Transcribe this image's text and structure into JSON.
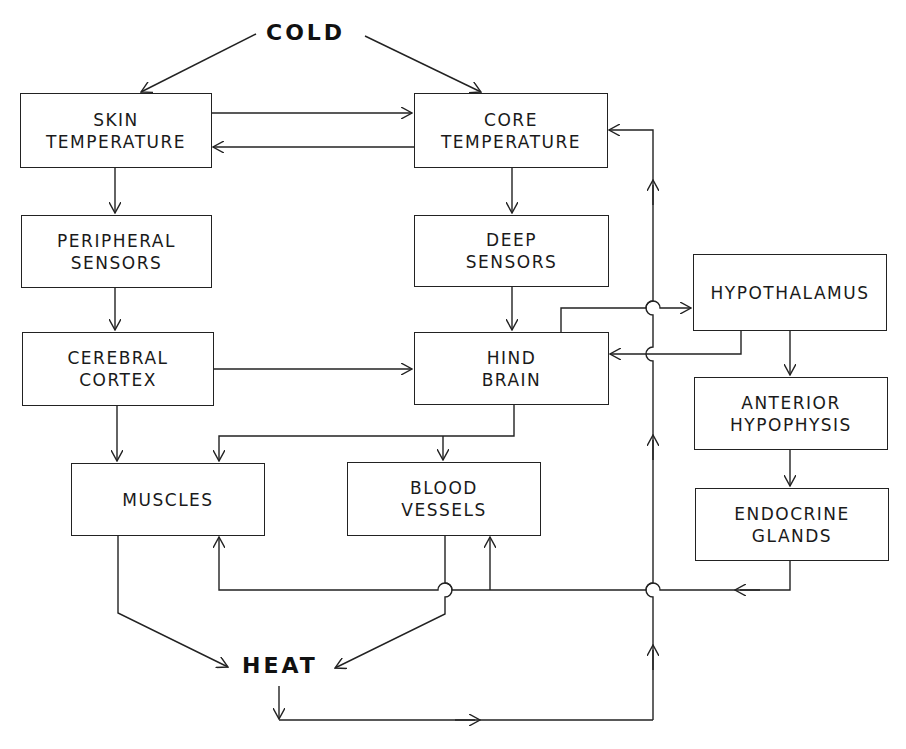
{
  "diagram": {
    "input_label": "COLD",
    "output_label": "HEAT",
    "nodes": {
      "skin_temperature": {
        "line1": "SKIN",
        "line2": "TEMPERATURE"
      },
      "core_temperature": {
        "line1": "CORE",
        "line2": "TEMPERATURE"
      },
      "peripheral_sensors": {
        "line1": "PERIPHERAL",
        "line2": "SENSORS"
      },
      "deep_sensors": {
        "line1": "DEEP",
        "line2": "SENSORS"
      },
      "cerebral_cortex": {
        "line1": "CEREBRAL",
        "line2": "CORTEX"
      },
      "hind_brain": {
        "line1": "HIND",
        "line2": "BRAIN"
      },
      "hypothalamus": {
        "line1": "HYPOTHALAMUS"
      },
      "anterior_hypophysis": {
        "line1": "ANTERIOR",
        "line2": "HYPOPHYSIS"
      },
      "endocrine_glands": {
        "line1": "ENDOCRINE",
        "line2": "GLANDS"
      },
      "muscles": {
        "line1": "MUSCLES"
      },
      "blood_vessels": {
        "line1": "BLOOD",
        "line2": "VESSELS"
      }
    },
    "edges": [
      {
        "from": "COLD",
        "to": "SKIN TEMPERATURE"
      },
      {
        "from": "COLD",
        "to": "CORE TEMPERATURE"
      },
      {
        "from": "SKIN TEMPERATURE",
        "to": "CORE TEMPERATURE"
      },
      {
        "from": "CORE TEMPERATURE",
        "to": "SKIN TEMPERATURE"
      },
      {
        "from": "SKIN TEMPERATURE",
        "to": "PERIPHERAL SENSORS"
      },
      {
        "from": "CORE TEMPERATURE",
        "to": "DEEP SENSORS"
      },
      {
        "from": "PERIPHERAL SENSORS",
        "to": "CEREBRAL CORTEX"
      },
      {
        "from": "DEEP SENSORS",
        "to": "HIND BRAIN"
      },
      {
        "from": "CEREBRAL CORTEX",
        "to": "HIND BRAIN"
      },
      {
        "from": "HIND BRAIN",
        "to": "HYPOTHALAMUS"
      },
      {
        "from": "HYPOTHALAMUS",
        "to": "HIND BRAIN"
      },
      {
        "from": "HYPOTHALAMUS",
        "to": "ANTERIOR HYPOPHYSIS"
      },
      {
        "from": "ANTERIOR HYPOPHYSIS",
        "to": "ENDOCRINE GLANDS"
      },
      {
        "from": "CEREBRAL CORTEX",
        "to": "MUSCLES"
      },
      {
        "from": "HIND BRAIN",
        "to": "MUSCLES"
      },
      {
        "from": "HIND BRAIN",
        "to": "BLOOD VESSELS"
      },
      {
        "from": "ENDOCRINE GLANDS",
        "to": "MUSCLES"
      },
      {
        "from": "ENDOCRINE GLANDS",
        "to": "BLOOD VESSELS"
      },
      {
        "from": "MUSCLES",
        "to": "HEAT"
      },
      {
        "from": "BLOOD VESSELS",
        "to": "HEAT"
      },
      {
        "from": "HEAT",
        "to": "CORE TEMPERATURE"
      }
    ]
  }
}
